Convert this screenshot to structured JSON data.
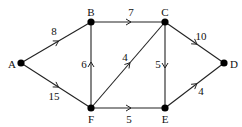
{
  "graph": {
    "type": "directed-weighted",
    "nodes": [
      {
        "id": "A",
        "label": "A",
        "x": 21,
        "y": 63,
        "label_dx": -9,
        "label_dy": 1
      },
      {
        "id": "B",
        "label": "B",
        "x": 91,
        "y": 22,
        "label_dx": 0,
        "label_dy": -10
      },
      {
        "id": "C",
        "label": "C",
        "x": 165,
        "y": 22,
        "label_dx": 0,
        "label_dy": -10
      },
      {
        "id": "D",
        "label": "D",
        "x": 224,
        "y": 63,
        "label_dx": 10,
        "label_dy": 1
      },
      {
        "id": "E",
        "label": "E",
        "x": 165,
        "y": 108,
        "label_dx": 0,
        "label_dy": 11
      },
      {
        "id": "F",
        "label": "F",
        "x": 91,
        "y": 108,
        "label_dx": 0,
        "label_dy": 11
      }
    ],
    "edges": [
      {
        "from": "A",
        "to": "B",
        "weight": "8",
        "label_x": 54,
        "label_y": 31
      },
      {
        "from": "A",
        "to": "F",
        "weight": "15",
        "label_x": 54,
        "label_y": 96
      },
      {
        "from": "B",
        "to": "C",
        "weight": "7",
        "label_x": 131,
        "label_y": 12
      },
      {
        "from": "F",
        "to": "B",
        "weight": "6",
        "label_x": 84,
        "label_y": 64
      },
      {
        "from": "F",
        "to": "C",
        "weight": "4",
        "label_x": 125,
        "label_y": 57
      },
      {
        "from": "C",
        "to": "E",
        "weight": "5",
        "label_x": 158,
        "label_y": 64
      },
      {
        "from": "C",
        "to": "D",
        "weight": "10",
        "label_x": 201,
        "label_y": 36
      },
      {
        "from": "F",
        "to": "E",
        "weight": "5",
        "label_x": 129,
        "label_y": 119
      },
      {
        "from": "E",
        "to": "D",
        "weight": "4",
        "label_x": 201,
        "label_y": 91
      }
    ]
  }
}
